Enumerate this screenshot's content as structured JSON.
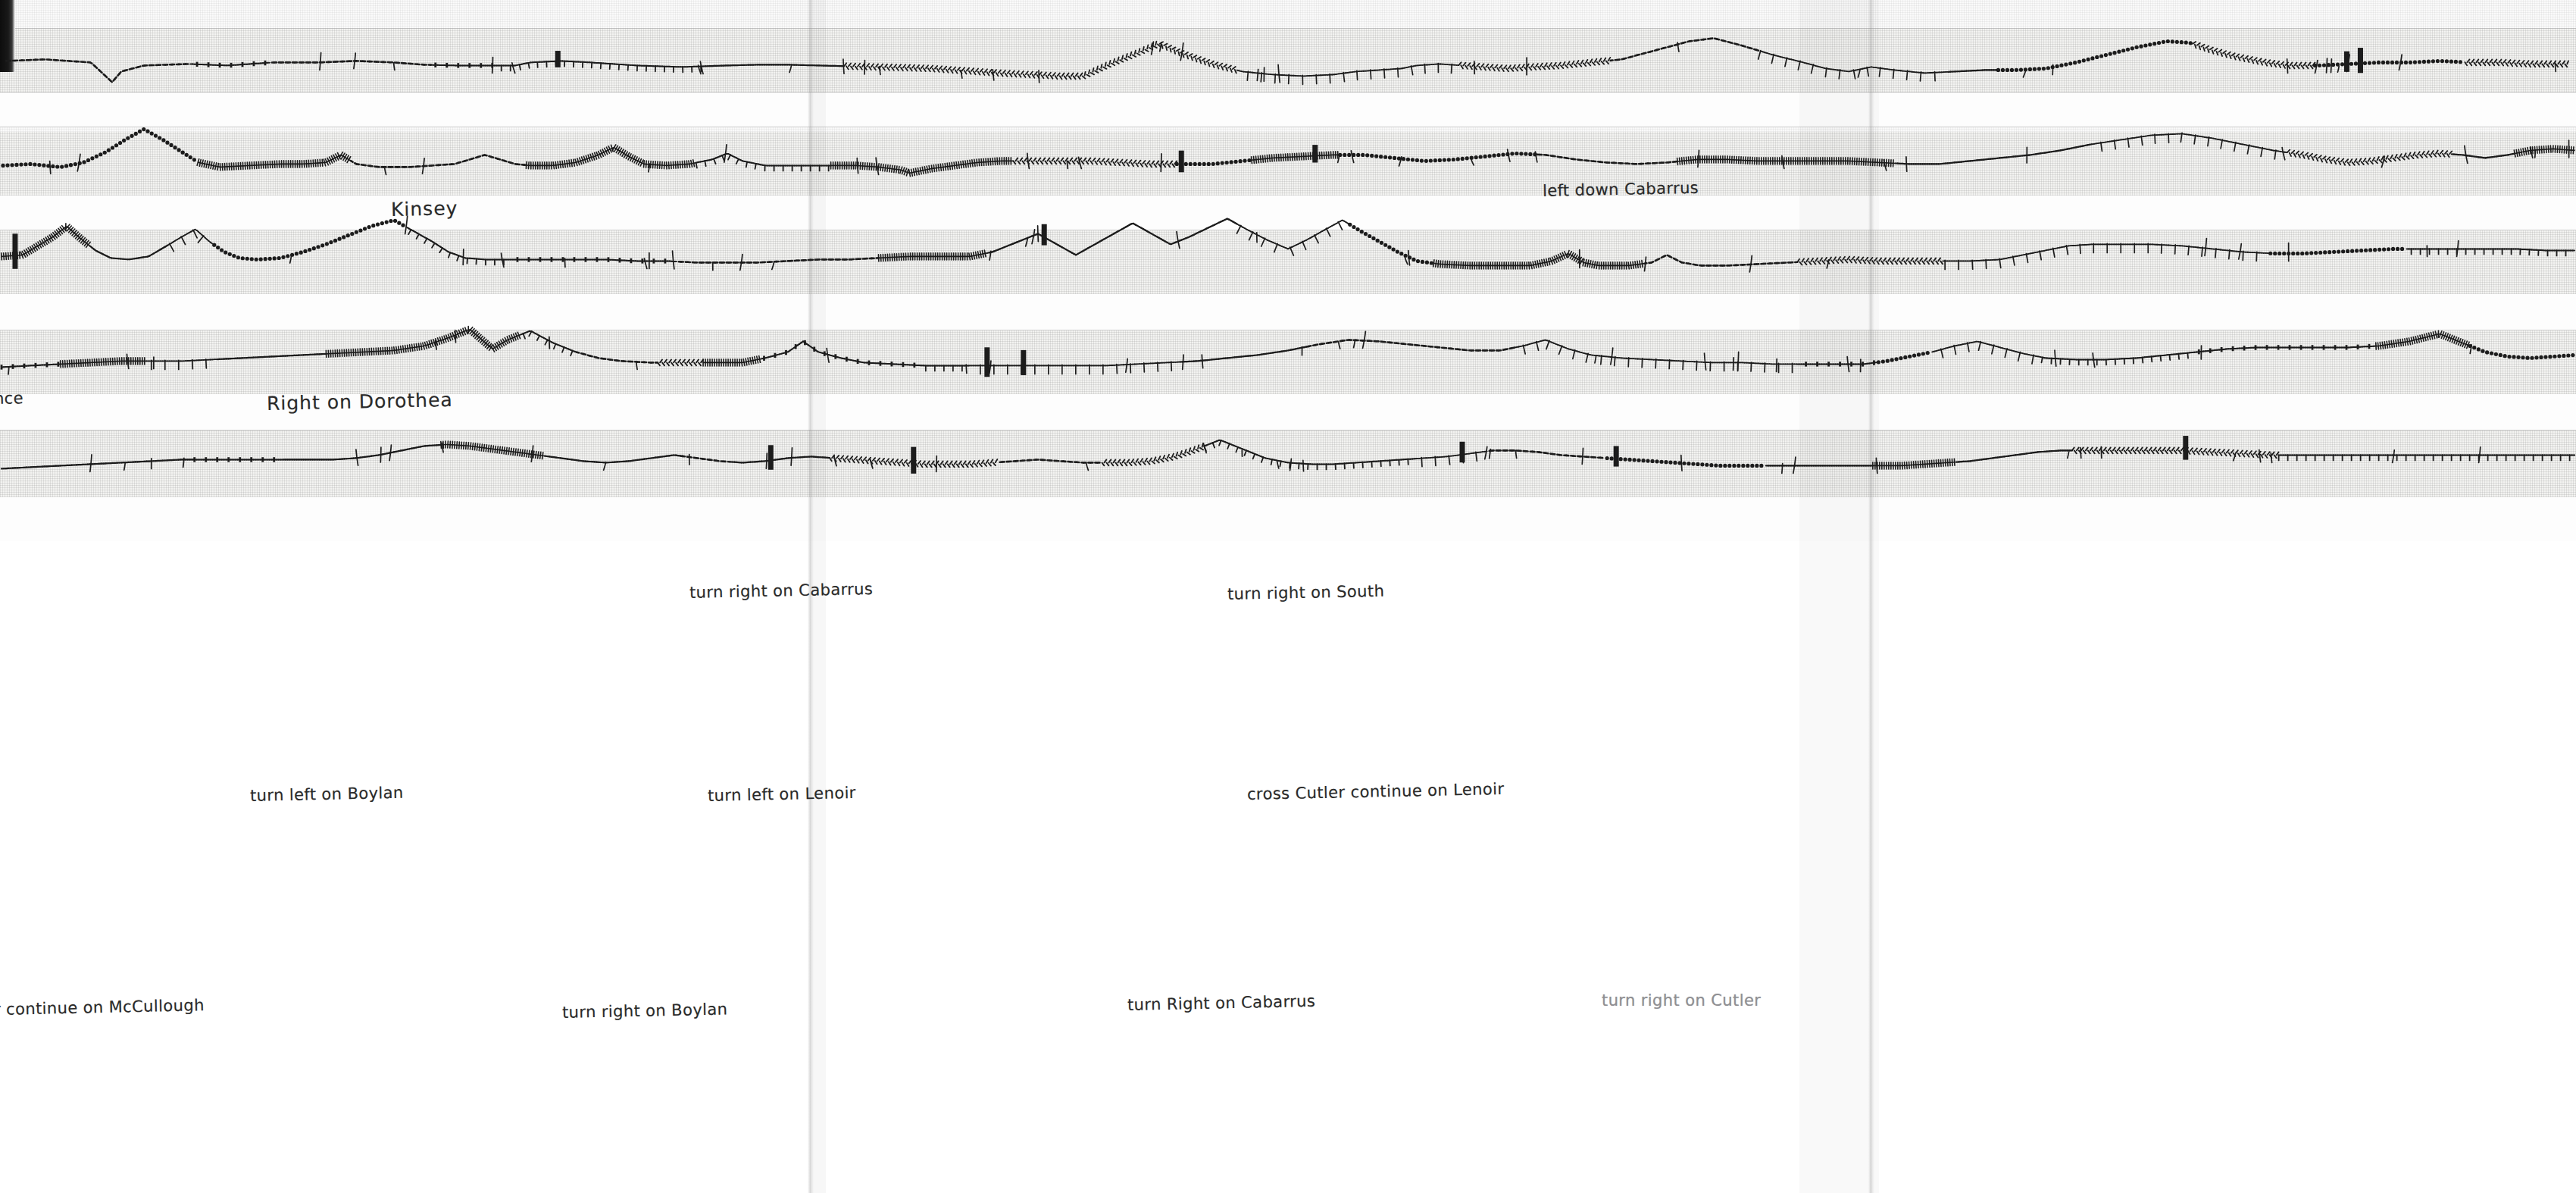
{
  "document": {
    "kind": "hand-drawn-scanned-route-sampler",
    "title": "Handwritten stitched route map with street directions",
    "rows": 5
  },
  "palette": {
    "ink": "#1c1c1c",
    "faded_ink": "#8f8f93",
    "paper": "#f3f3f1",
    "paper_light": "#fafafa",
    "scan_edge": "#0d0d0d"
  },
  "annotations": [
    {
      "id": "kinsey",
      "text": "Kinsey",
      "row": 1,
      "x": 258,
      "y": 131,
      "size": "big",
      "style": "tilt"
    },
    {
      "id": "left-down-cabarrus",
      "text": "left down Cabarrus",
      "row": 1,
      "x": 1018,
      "y": 120,
      "size": "normal",
      "style": "tilt"
    },
    {
      "id": "cross-cabarrus-to-florence",
      "text": "cross Cabarrus to Florence",
      "row": 1,
      "x": 2371,
      "y": 116,
      "size": "big",
      "style": "tilt"
    },
    {
      "id": "florence-cont",
      "text": "nce",
      "row": 2,
      "x": -4,
      "y": 257,
      "size": "normal",
      "style": "tilt"
    },
    {
      "id": "right-on-dorothea",
      "text": "Right on Dorothea",
      "row": 2,
      "x": 176,
      "y": 259,
      "size": "big",
      "style": "tilt"
    },
    {
      "id": "cross-boylan-continue-down-dorothea",
      "text": "cross Boylan continue down Dorothea",
      "row": 2,
      "x": 2846,
      "y": 257,
      "size": "normal",
      "style": "tilt"
    },
    {
      "id": "turn-right-on-cabarrus",
      "text": "turn right on Cabarrus",
      "row": 3,
      "x": 455,
      "y": 385,
      "size": "normal",
      "style": "tilt"
    },
    {
      "id": "turn-right-on-south",
      "text": "turn right on South",
      "row": 3,
      "x": 810,
      "y": 386,
      "size": "normal",
      "style": "tilt"
    },
    {
      "id": "turn-left-on-boylan",
      "text": "turn left on Boylan",
      "row": 4,
      "x": 165,
      "y": 519,
      "size": "normal",
      "style": "tilt"
    },
    {
      "id": "turn-left-on-lenoir",
      "text": "turn left on Lenoir",
      "row": 4,
      "x": 467,
      "y": 519,
      "size": "normal",
      "style": "tilt"
    },
    {
      "id": "cross-cutler-continue-on-lenoir",
      "text": "cross Cutler continue on Lenoir",
      "row": 4,
      "x": 823,
      "y": 518,
      "size": "normal",
      "style": "tilt"
    },
    {
      "id": "cross-cabarrus-cut",
      "text": "cross Cabarru",
      "row": 4,
      "x": 3302,
      "y": 517,
      "size": "normal",
      "style": "tilt"
    },
    {
      "id": "continue-on-mccullough",
      "text": "r continue on McCullough",
      "row": 5,
      "x": -4,
      "y": 660,
      "size": "normal",
      "style": "tilt"
    },
    {
      "id": "turn-right-on-boylan",
      "text": "turn right on Boylan",
      "row": 5,
      "x": 371,
      "y": 662,
      "size": "normal",
      "style": "tilt"
    },
    {
      "id": "turn-right-on-cabarrus-2",
      "text": "turn Right on Cabarrus",
      "row": 5,
      "x": 744,
      "y": 657,
      "size": "normal",
      "style": "tilt"
    },
    {
      "id": "turn-right-on-cutler",
      "text": "turn right on Cutler",
      "row": 5,
      "x": 1057,
      "y": 654,
      "size": "normal",
      "style": "faded"
    }
  ],
  "rows": [
    {
      "id": "row-1",
      "index": 1,
      "top": 36,
      "band_top": 42,
      "band_height": 78,
      "baseline": 98,
      "labels": [
        "Kinsey",
        "left down Cabarrus",
        "cross Cabarrus to Florence"
      ],
      "stitch_path": "M 8,98 L 60,96 L 120,100 L 148,126 L 160,112 L 190,104 L 250,102 L 300,104 L 360,100 L 420,100 L 470,98 L 520,100 L 560,103 L 600,104 L 640,104 L 680,104 L 700,100 L 740,98 L 780,100 L 810,102 L 840,104 L 870,105 L 900,106 L 930,105 L 960,104 L 1000,103 L 1040,103 L 1080,104 L 1120,105 L 1160,106 L 1200,107 L 1230,108 L 1260,110 L 1290,112 L 1320,114 L 1360,116 L 1400,118 L 1430,118 L 1465,102 L 1500,88 L 1530,75 L 1560,88 L 1600,102 L 1640,112 L 1680,116 L 1720,118 L 1760,116 L 1790,112 L 1820,110 L 1850,108 L 1870,104 L 1900,102 L 1930,104 L 1960,106 L 1990,108 L 2020,106 L 2060,104 L 2100,100 L 2140,96 L 2170,88 L 2200,80 L 2230,72 L 2262,68 L 2300,78 L 2340,90 L 2380,100 L 2410,108 L 2440,112 L 2470,106 L 2500,110 L 2540,114 L 2580,112 L 2620,110 L 2660,110 L 2700,108 L 2740,100 L 2780,90 L 2820,80 L 2860,72 L 2890,74 L 2920,84 L 2950,92 L 2990,100 L 3020,104 L 3060,104 L 3100,102 L 3140,100 L 3180,100 L 3220,98 L 3260,100 L 3300,100 L 3340,102 L 3390,102"
    },
    {
      "id": "row-2",
      "index": 2,
      "top": 168,
      "band_top": 172,
      "band_height": 86,
      "baseline": 240,
      "labels": [
        "nce",
        "Right on Dorothea",
        "cross Boylan continue down Dorothea"
      ],
      "stitch_path": "M 4,246 L 40,244 L 80,248 L 110,242 L 140,228 L 165,212 L 190,198 L 215,212 L 240,228 L 262,242 L 290,248 L 330,246 L 370,244 L 400,244 L 430,242 L 450,232 L 470,244 L 500,248 L 540,248 L 570,246 L 600,244 L 620,238 L 640,232 L 660,238 L 680,244 L 700,246 L 730,246 L 760,242 L 790,232 L 810,222 L 830,234 L 850,244 L 880,246 L 910,244 L 940,238 L 960,230 L 980,240 L 1010,246 L 1050,246 L 1090,246 L 1130,246 L 1160,248 L 1190,252 L 1200,256 L 1230,250 L 1260,246 L 1290,242 L 1320,240 L 1360,240 L 1400,240 L 1440,240 L 1480,242 L 1520,244 L 1560,244 L 1600,244 L 1640,240 L 1680,236 L 1720,234 L 1760,232 L 1800,232 L 1840,236 L 1880,240 L 1920,238 L 1960,234 L 2000,230 L 2040,232 L 2080,238 L 2120,242 L 2160,244 L 2200,242 L 2240,238 L 2280,238 L 2320,240 L 2360,240 L 2400,240 L 2440,240 L 2480,242 L 2520,244 L 2560,244 L 2600,240 L 2640,236 L 2680,232 L 2720,226 L 2760,218 L 2800,212 L 2840,206 L 2880,204 L 2920,210 L 2960,218 L 3000,226 L 3040,232 L 3070,238 L 3100,242 L 3130,240 L 3160,236 L 3190,232 L 3220,230 L 3250,232 L 3280,236 L 3310,232 L 3340,226 L 3370,224 L 3398,226"
    },
    {
      "id": "row-3",
      "index": 3,
      "top": 300,
      "band_top": 304,
      "band_height": 86,
      "baseline": 372,
      "labels": [
        "turn right on Cabarrus",
        "turn right on South"
      ],
      "stitch_path": "M 2,366 L 30,364 L 50,352 L 70,340 L 88,326 L 106,342 L 126,358 L 146,368 L 170,370 L 196,366 L 220,352 L 240,340 L 258,330 L 276,346 L 296,360 L 316,368 L 340,370 L 370,368 L 400,360 L 430,350 L 460,338 L 490,326 L 520,318 L 545,332 L 570,346 L 592,360 L 614,368 L 640,370 L 680,370 L 720,370 L 760,370 L 800,370 L 840,372 L 880,372 L 920,374 L 960,374 L 1000,374 L 1040,372 L 1080,370 L 1120,370 L 1160,368 L 1200,366 L 1240,366 L 1280,366 L 1310,360 L 1340,348 L 1370,336 L 1395,350 L 1420,364 L 1445,350 L 1470,336 L 1495,322 L 1520,336 L 1545,350 L 1570,340 L 1595,328 L 1620,316 L 1645,330 L 1672,344 L 1700,356 L 1725,344 L 1750,330 L 1772,318 L 1795,332 L 1820,346 L 1845,360 L 1870,372 L 1900,376 L 1940,378 L 1980,378 L 2020,378 L 2048,372 L 2070,362 L 2090,374 L 2110,378 L 2150,378 L 2180,374 L 2200,364 L 2220,374 L 2245,378 L 2280,378 L 2320,376 L 2360,374 L 2400,372 L 2440,370 L 2480,372 L 2520,372 L 2560,372 L 2600,372 L 2640,370 L 2670,364 L 2700,358 L 2730,352 L 2760,350 L 2800,350 L 2840,350 L 2880,352 L 2920,356 L 2960,360 L 3000,362 L 3040,362 L 3080,360 L 3120,358 L 3160,356 L 3200,356 L 3240,356 L 3280,356 L 3320,356 L 3360,358 L 3398,358"
    },
    {
      "id": "row-4",
      "index": 4,
      "top": 432,
      "band_top": 436,
      "band_height": 86,
      "baseline": 504,
      "labels": [
        "turn left on Boylan",
        "turn left on Lenoir",
        "cross Cutler continue on Lenoir",
        "cross Cabarru"
      ],
      "stitch_path": "M 2,512 L 40,510 L 80,508 L 120,506 L 160,504 L 200,504 L 240,504 L 280,502 L 320,500 L 360,498 L 400,496 L 440,494 L 480,492 L 520,490 L 560,484 L 590,474 L 620,462 L 650,488 L 670,476 L 700,464 L 730,480 L 760,492 L 790,500 L 820,504 L 860,506 L 900,506 L 940,506 L 980,506 L 1010,500 L 1040,492 L 1060,478 L 1080,492 L 1110,500 L 1140,506 L 1180,508 L 1220,510 L 1260,510 L 1300,510 L 1340,510 L 1380,510 L 1420,510 L 1460,510 L 1500,508 L 1540,506 L 1580,504 L 1620,500 L 1660,496 L 1700,490 L 1740,482 L 1780,476 L 1820,478 L 1860,482 L 1900,486 L 1940,490 L 1980,490 L 2010,484 L 2040,476 L 2070,488 L 2100,496 L 2140,500 L 2180,502 L 2220,504 L 2260,506 L 2300,506 L 2340,508 L 2380,508 L 2420,508 L 2460,508 L 2490,504 L 2520,498 L 2550,492 L 2580,484 L 2610,478 L 2640,486 L 2670,494 L 2700,500 L 2740,502 L 2780,502 L 2820,500 L 2860,496 L 2900,492 L 2940,488 L 2980,486 L 3020,486 L 3060,486 L 3100,486 L 3140,484 L 3180,478 L 3220,468 L 3250,480 L 3280,492 L 3310,498 L 3340,500 L 3370,498 L 3398,496"
    },
    {
      "id": "row-5",
      "index": 5,
      "top": 564,
      "band_top": 568,
      "band_height": 90,
      "baseline": 640,
      "labels": [
        "r continue on McCullough",
        "turn right on Boylan",
        "turn Right on Cabarrus",
        "turn right on Cutler"
      ],
      "stitch_path": "M 2,650 L 40,648 L 80,646 L 120,644 L 160,642 L 200,640 L 240,638 L 280,638 L 320,638 L 360,638 L 400,638 L 440,638 L 470,636 L 500,632 L 530,626 L 560,620 L 590,618 L 620,620 L 650,624 L 680,628 L 710,632 L 740,636 L 770,640 L 800,642 L 830,640 L 860,636 L 890,632 L 920,636 L 950,640 L 980,642 L 1010,640 L 1040,636 L 1070,634 L 1100,636 L 1130,638 L 1160,640 L 1190,642 L 1220,644 L 1250,644 L 1280,644 L 1310,642 L 1340,640 L 1370,638 L 1400,640 L 1430,642 L 1460,642 L 1490,642 L 1520,640 L 1550,634 L 1580,624 L 1610,612 L 1640,624 L 1670,636 L 1700,642 L 1730,644 L 1760,644 L 1790,642 L 1820,640 L 1850,638 L 1880,636 L 1910,634 L 1940,630 L 1970,626 L 2000,626 L 2030,628 L 2060,632 L 2090,634 L 2120,636 L 2150,638 L 2180,640 L 2210,642 L 2240,644 L 2270,646 L 2300,646 L 2330,646 L 2360,646 L 2390,646 L 2420,646 L 2450,646 L 2480,646 L 2510,646 L 2540,644 L 2570,642 L 2600,640 L 2630,636 L 2660,632 L 2690,628 L 2720,626 L 2760,626 L 2800,626 L 2840,626 L 2880,626 L 2920,628 L 2960,630 L 3000,632 L 3040,632 L 3080,632 L 3120,632 L 3160,632 L 3200,632 L 3240,632 L 3280,632 L 3320,632 L 3360,632 L 3398,632"
    }
  ]
}
